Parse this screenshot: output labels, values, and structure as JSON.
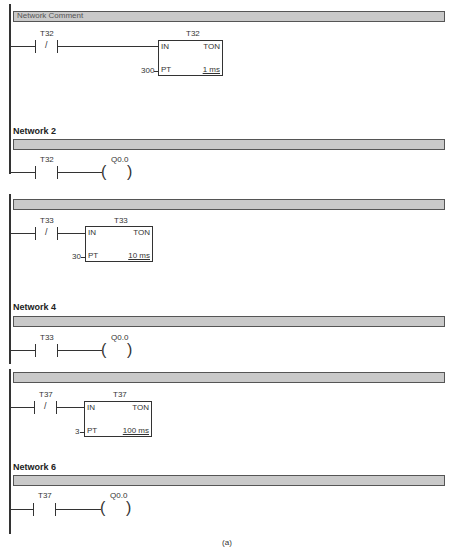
{
  "networks": [
    {
      "id": 1,
      "label": "",
      "comment": "Network Comment",
      "rungs": [
        {
          "contact": {
            "address": "T32",
            "type": "normally-closed",
            "symbol": "/"
          },
          "timer": {
            "address": "T32",
            "type": "TON",
            "in": "IN",
            "pt_label": "PT",
            "pt_value": "300",
            "resolution": "1 ms"
          }
        }
      ]
    },
    {
      "id": 2,
      "label": "Network 2",
      "rungs": [
        {
          "contact": {
            "address": "T32",
            "type": "normally-open"
          },
          "coil": {
            "address": "Q0.0",
            "symbol_left": "(",
            "symbol_right": ")"
          }
        }
      ]
    },
    {
      "id": 3,
      "label": "",
      "rungs": [
        {
          "contact": {
            "address": "T33",
            "type": "normally-closed",
            "symbol": "/"
          },
          "timer": {
            "address": "T33",
            "type": "TON",
            "in": "IN",
            "pt_label": "PT",
            "pt_value": "30",
            "resolution": "10 ms"
          }
        }
      ]
    },
    {
      "id": 4,
      "label": "Network 4",
      "rungs": [
        {
          "contact": {
            "address": "T33",
            "type": "normally-open"
          },
          "coil": {
            "address": "Q0.0",
            "symbol_left": "(",
            "symbol_right": ")"
          }
        }
      ]
    },
    {
      "id": 5,
      "label": "",
      "rungs": [
        {
          "contact": {
            "address": "T37",
            "type": "normally-closed",
            "symbol": "/"
          },
          "timer": {
            "address": "T37",
            "type": "TON",
            "in": "IN",
            "pt_label": "PT",
            "pt_value": "3",
            "resolution": "100 ms"
          }
        }
      ]
    },
    {
      "id": 6,
      "label": "Network 6",
      "rungs": [
        {
          "contact": {
            "address": "T37",
            "type": "normally-open"
          },
          "coil": {
            "address": "Q0.0",
            "symbol_left": "(",
            "symbol_right": ")"
          }
        }
      ]
    }
  ],
  "caption": "(a)"
}
